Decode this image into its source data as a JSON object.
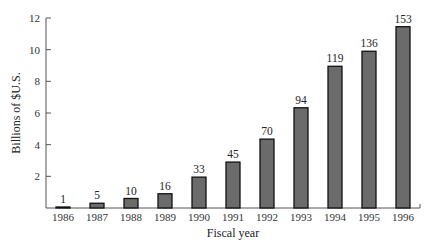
{
  "chart_data": {
    "type": "bar",
    "title": "",
    "xlabel": "Fiscal year",
    "ylabel": "Billions of $U.S.",
    "ylim": [
      0,
      12
    ],
    "yticks": [
      2,
      4,
      6,
      8,
      10,
      12
    ],
    "grid": false,
    "legend": null,
    "categories": [
      "1986",
      "1987",
      "1988",
      "1989",
      "1990",
      "1991",
      "1992",
      "1993",
      "1994",
      "1995",
      "1996"
    ],
    "values": [
      0.05,
      0.3,
      0.6,
      0.9,
      1.95,
      2.9,
      4.35,
      6.33,
      8.95,
      9.9,
      11.45
    ],
    "data_labels": [
      "1",
      "5",
      "10",
      "16",
      "33",
      "45",
      "70",
      "94",
      "119",
      "136",
      "153"
    ],
    "bar_color": "#6b6b6b",
    "bar_edge_color": "#111111"
  }
}
